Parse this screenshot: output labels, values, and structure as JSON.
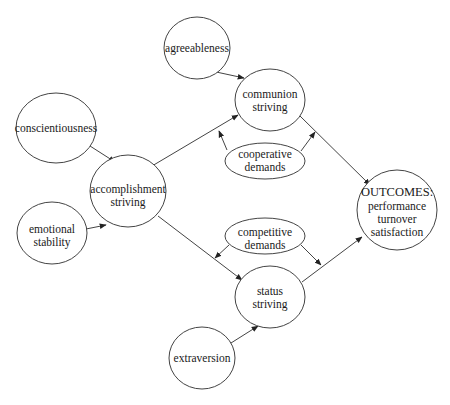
{
  "diagram": {
    "type": "path-model",
    "nodes": {
      "agreeableness": {
        "lines": [
          "agreeableness"
        ]
      },
      "communion_striving": {
        "lines": [
          "communion",
          "striving"
        ]
      },
      "conscientiousness": {
        "lines": [
          "conscientiousness"
        ]
      },
      "cooperative_demands": {
        "lines": [
          "cooperative",
          "demands"
        ]
      },
      "accomplishment_striving": {
        "lines": [
          "accomplishment",
          "striving"
        ]
      },
      "emotional_stability": {
        "lines": [
          "emotional",
          "stability"
        ]
      },
      "competitive_demands": {
        "lines": [
          "competitive",
          "demands"
        ]
      },
      "outcomes": {
        "lines": [
          "OUTCOMES:",
          "performance",
          "turnover",
          "satisfaction"
        ]
      },
      "status_striving": {
        "lines": [
          "status",
          "striving"
        ]
      },
      "extraversion": {
        "lines": [
          "extraversion"
        ]
      }
    },
    "edges": [
      {
        "from": "agreeableness",
        "to": "communion_striving"
      },
      {
        "from": "conscientiousness",
        "to": "accomplishment_striving"
      },
      {
        "from": "emotional_stability",
        "to": "accomplishment_striving"
      },
      {
        "from": "accomplishment_striving",
        "to": "communion_striving"
      },
      {
        "from": "accomplishment_striving",
        "to": "status_striving"
      },
      {
        "from": "extraversion",
        "to": "status_striving"
      },
      {
        "from": "communion_striving",
        "to": "outcomes"
      },
      {
        "from": "status_striving",
        "to": "outcomes"
      },
      {
        "from": "cooperative_demands",
        "to": "edge:accomplishment_striving->communion_striving",
        "kind": "moderator"
      },
      {
        "from": "cooperative_demands",
        "to": "edge:communion_striving->outcomes",
        "kind": "moderator"
      },
      {
        "from": "competitive_demands",
        "to": "edge:accomplishment_striving->status_striving",
        "kind": "moderator"
      },
      {
        "from": "competitive_demands",
        "to": "edge:status_striving->outcomes",
        "kind": "moderator"
      }
    ]
  }
}
